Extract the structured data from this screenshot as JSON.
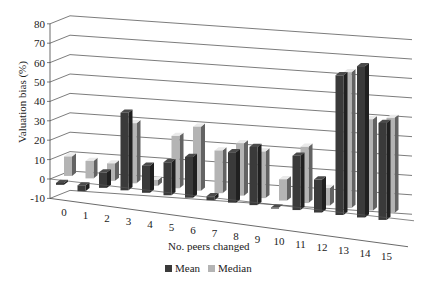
{
  "chart_data": {
    "type": "bar",
    "subtype": "3d-clustered-column",
    "title": "",
    "xlabel": "No. peers changed",
    "ylabel": "Valuation bias (%)",
    "categories": [
      "0",
      "1",
      "2",
      "3",
      "4",
      "5",
      "6",
      "7",
      "8",
      "9",
      "10",
      "11",
      "12",
      "13",
      "14",
      "15"
    ],
    "series": [
      {
        "name": "Mean",
        "color": "#3a3a3a",
        "values": [
          -1,
          -3,
          8,
          40,
          14,
          17,
          21,
          2,
          26,
          30,
          0,
          28,
          17,
          72,
          78,
          50
        ]
      },
      {
        "name": "Median",
        "color": "#b4b4b4",
        "values": [
          10,
          9,
          9,
          31,
          3,
          27,
          33,
          22,
          27,
          24,
          11,
          29,
          9,
          70,
          47,
          49
        ]
      }
    ],
    "ylim": [
      -10,
      80
    ],
    "yticks": [
      -10,
      0,
      10,
      20,
      30,
      40,
      50,
      60,
      70,
      80
    ],
    "grid": true,
    "legend_position": "bottom"
  },
  "legend": {
    "mean_label": "Mean",
    "median_label": "Median"
  }
}
